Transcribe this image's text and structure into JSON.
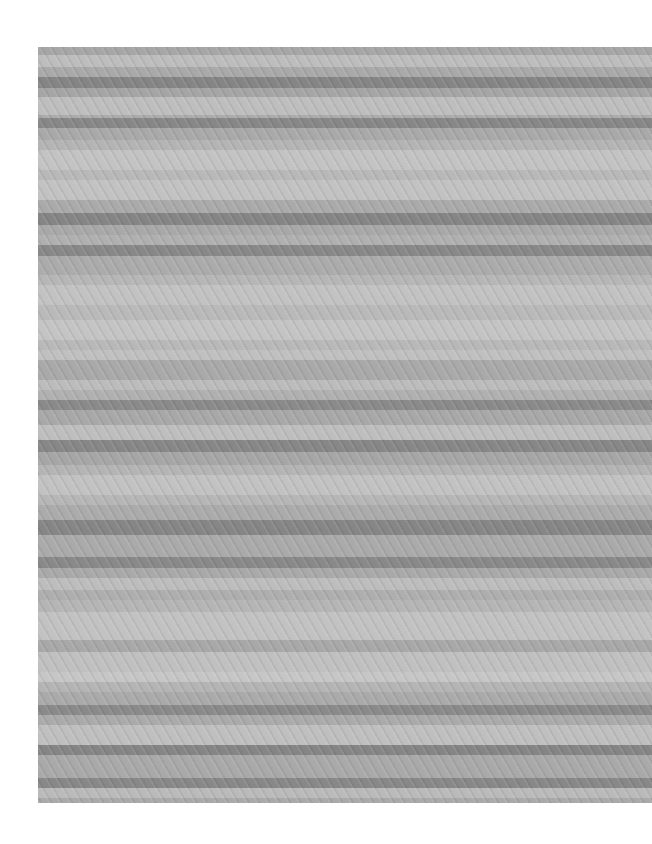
{
  "image": {
    "description": "Photograph of grey horizontally striped fabric on white background",
    "colors": {
      "background": "#ffffff",
      "dark": "#868686",
      "medium": "#a9a9a9",
      "light_medium": "#b6b6b6",
      "light": "#c1c1c1"
    },
    "stripes": [
      {
        "top": 0,
        "height": 8,
        "color": "#a6a6a6"
      },
      {
        "top": 8,
        "height": 12,
        "color": "#bdbdbd"
      },
      {
        "top": 20,
        "height": 10,
        "color": "#a9a9a9"
      },
      {
        "top": 30,
        "height": 11,
        "color": "#858585"
      },
      {
        "top": 41,
        "height": 9,
        "color": "#a5a5a5"
      },
      {
        "top": 50,
        "height": 18,
        "color": "#bebebe"
      },
      {
        "top": 68,
        "height": 3,
        "color": "#ababab"
      },
      {
        "top": 71,
        "height": 10,
        "color": "#878787"
      },
      {
        "top": 81,
        "height": 12,
        "color": "#a9a9a9"
      },
      {
        "top": 93,
        "height": 10,
        "color": "#b4b4b4"
      },
      {
        "top": 103,
        "height": 20,
        "color": "#c3c3c3"
      },
      {
        "top": 123,
        "height": 10,
        "color": "#b8b8b8"
      },
      {
        "top": 133,
        "height": 20,
        "color": "#c2c2c2"
      },
      {
        "top": 153,
        "height": 13,
        "color": "#aaaaaa"
      },
      {
        "top": 166,
        "height": 12,
        "color": "#858585"
      },
      {
        "top": 178,
        "height": 10,
        "color": "#a8a8a8"
      },
      {
        "top": 188,
        "height": 10,
        "color": "#b0b0b0"
      },
      {
        "top": 198,
        "height": 11,
        "color": "#888888"
      },
      {
        "top": 209,
        "height": 19,
        "color": "#ababab"
      },
      {
        "top": 228,
        "height": 10,
        "color": "#b6b6b6"
      },
      {
        "top": 238,
        "height": 20,
        "color": "#c2c2c2"
      },
      {
        "top": 258,
        "height": 15,
        "color": "#b9b9b9"
      },
      {
        "top": 273,
        "height": 20,
        "color": "#c4c4c4"
      },
      {
        "top": 293,
        "height": 10,
        "color": "#b8b8b8"
      },
      {
        "top": 303,
        "height": 10,
        "color": "#c0c0c0"
      },
      {
        "top": 313,
        "height": 20,
        "color": "#a9a9a9"
      },
      {
        "top": 333,
        "height": 10,
        "color": "#bcbcbc"
      },
      {
        "top": 343,
        "height": 10,
        "color": "#b0b0b0"
      },
      {
        "top": 353,
        "height": 10,
        "color": "#8a8a8a"
      },
      {
        "top": 363,
        "height": 15,
        "color": "#a8a8a8"
      },
      {
        "top": 378,
        "height": 15,
        "color": "#bebebe"
      },
      {
        "top": 393,
        "height": 12,
        "color": "#878787"
      },
      {
        "top": 405,
        "height": 13,
        "color": "#a6a6a6"
      },
      {
        "top": 418,
        "height": 10,
        "color": "#b4b4b4"
      },
      {
        "top": 428,
        "height": 20,
        "color": "#c2c2c2"
      },
      {
        "top": 448,
        "height": 10,
        "color": "#b6b6b6"
      },
      {
        "top": 458,
        "height": 15,
        "color": "#ababab"
      },
      {
        "top": 473,
        "height": 15,
        "color": "#868686"
      },
      {
        "top": 488,
        "height": 22,
        "color": "#aaaaaa"
      },
      {
        "top": 510,
        "height": 11,
        "color": "#898989"
      },
      {
        "top": 521,
        "height": 10,
        "color": "#a9a9a9"
      },
      {
        "top": 531,
        "height": 12,
        "color": "#bdbdbd"
      },
      {
        "top": 543,
        "height": 10,
        "color": "#aeaeae"
      },
      {
        "top": 553,
        "height": 12,
        "color": "#b5b5b5"
      },
      {
        "top": 565,
        "height": 28,
        "color": "#c2c2c2"
      },
      {
        "top": 593,
        "height": 12,
        "color": "#a8a8a8"
      },
      {
        "top": 605,
        "height": 20,
        "color": "#c0c0c0"
      },
      {
        "top": 625,
        "height": 10,
        "color": "#c6c6c6"
      },
      {
        "top": 635,
        "height": 10,
        "color": "#b4b4b4"
      },
      {
        "top": 645,
        "height": 13,
        "color": "#aaaaaa"
      },
      {
        "top": 658,
        "height": 10,
        "color": "#8a8a8a"
      },
      {
        "top": 668,
        "height": 10,
        "color": "#aaaaaa"
      },
      {
        "top": 678,
        "height": 20,
        "color": "#bfbfbf"
      },
      {
        "top": 698,
        "height": 10,
        "color": "#858585"
      },
      {
        "top": 708,
        "height": 23,
        "color": "#a9a9a9"
      },
      {
        "top": 731,
        "height": 10,
        "color": "#888888"
      },
      {
        "top": 741,
        "height": 10,
        "color": "#bababa"
      },
      {
        "top": 751,
        "height": 5,
        "color": "#a9a9a9"
      }
    ]
  }
}
